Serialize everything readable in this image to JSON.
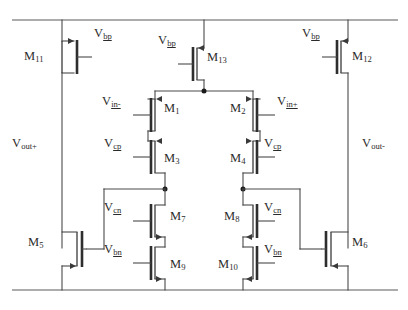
{
  "diagram": {
    "type": "circuit-schematic",
    "width": 408,
    "height": 310,
    "background_color": "#ffffff",
    "wire_color": "#4a4a4a",
    "label_color": "#2b2b2b"
  },
  "rails": {
    "top": {
      "name": "vdd-rail",
      "y": 20,
      "x1": 12,
      "x2": 398
    },
    "bottom": {
      "name": "gnd-rail",
      "y": 290,
      "x1": 12,
      "x2": 398
    }
  },
  "transistors": [
    {
      "id": "M11",
      "base": "M",
      "sub": "11",
      "type": "pmos",
      "gate_label": "Vbp",
      "gate_label_side": "right",
      "id_side": "left"
    },
    {
      "id": "M13",
      "base": "M",
      "sub": "13",
      "type": "pmos",
      "gate_label": "Vbp",
      "gate_label_side": "left",
      "id_side": "right"
    },
    {
      "id": "M12",
      "base": "M",
      "sub": "12",
      "type": "pmos",
      "gate_label": "Vbp",
      "gate_label_side": "left",
      "id_side": "right"
    },
    {
      "id": "M1",
      "base": "M",
      "sub": "1",
      "type": "pmos",
      "gate_label": "Vin-",
      "gate_label_side": "left",
      "id_side": "right"
    },
    {
      "id": "M2",
      "base": "M",
      "sub": "2",
      "type": "pmos",
      "gate_label": "Vin+",
      "gate_label_side": "right",
      "id_side": "left"
    },
    {
      "id": "M3",
      "base": "M",
      "sub": "3",
      "type": "pmos",
      "gate_label": "Vcp",
      "gate_label_side": "left",
      "id_side": "right"
    },
    {
      "id": "M4",
      "base": "M",
      "sub": "4",
      "type": "pmos",
      "gate_label": "Vcp",
      "gate_label_side": "right",
      "id_side": "left"
    },
    {
      "id": "M7",
      "base": "M",
      "sub": "7",
      "type": "nmos",
      "gate_label": "Vcn",
      "gate_label_side": "left",
      "id_side": "right"
    },
    {
      "id": "M8",
      "base": "M",
      "sub": "8",
      "type": "nmos",
      "gate_label": "Vcn",
      "gate_label_side": "right",
      "id_side": "left"
    },
    {
      "id": "M9",
      "base": "M",
      "sub": "9",
      "type": "nmos",
      "gate_label": "Vbn",
      "gate_label_side": "left",
      "id_side": "right"
    },
    {
      "id": "M10",
      "base": "M",
      "sub": "10",
      "type": "nmos",
      "gate_label": "Vbn",
      "gate_label_side": "right",
      "id_side": "left"
    },
    {
      "id": "M5",
      "base": "M",
      "sub": "5",
      "type": "nmos",
      "gate_label": "",
      "gate_label_side": "none",
      "id_side": "left"
    },
    {
      "id": "M6",
      "base": "M",
      "sub": "6",
      "type": "nmos",
      "gate_label": "",
      "gate_label_side": "none",
      "id_side": "right"
    }
  ],
  "labels": {
    "m11": {
      "base": "M",
      "sub": "11"
    },
    "m12": {
      "base": "M",
      "sub": "12"
    },
    "m13": {
      "base": "M",
      "sub": "13"
    },
    "m1": {
      "base": "M",
      "sub": "1"
    },
    "m2": {
      "base": "M",
      "sub": "2"
    },
    "m3": {
      "base": "M",
      "sub": "3"
    },
    "m4": {
      "base": "M",
      "sub": "4"
    },
    "m5": {
      "base": "M",
      "sub": "5"
    },
    "m6": {
      "base": "M",
      "sub": "6"
    },
    "m7": {
      "base": "M",
      "sub": "7"
    },
    "m8": {
      "base": "M",
      "sub": "8"
    },
    "m9": {
      "base": "M",
      "sub": "9"
    },
    "m10": {
      "base": "M",
      "sub": "10"
    },
    "vbp_left": {
      "base": "V",
      "sub": "bp"
    },
    "vbp_mid": {
      "base": "V",
      "sub": "bp"
    },
    "vbp_right": {
      "base": "V",
      "sub": "bp"
    },
    "vin_minus": {
      "base": "V",
      "sub": "in-"
    },
    "vin_plus": {
      "base": "V",
      "sub": "in+"
    },
    "vcp_left": {
      "base": "V",
      "sub": "cp"
    },
    "vcp_right": {
      "base": "V",
      "sub": "cp"
    },
    "vcn_left": {
      "base": "V",
      "sub": "cn"
    },
    "vcn_right": {
      "base": "V",
      "sub": "cn"
    },
    "vbn_left": {
      "base": "V",
      "sub": "bn"
    },
    "vbn_right": {
      "base": "V",
      "sub": "bn"
    },
    "vout_plus": {
      "base": "V",
      "sub": "out+"
    },
    "vout_minus": {
      "base": "V",
      "sub": "out-"
    }
  },
  "nets": [
    {
      "name": "vdd",
      "label": "top supply rail"
    },
    {
      "name": "gnd",
      "label": "bottom ground rail"
    },
    {
      "name": "tail",
      "label": "M13 drain to M1/M2 common source"
    },
    {
      "name": "vout-plus",
      "label": "left output node"
    },
    {
      "name": "vout-minus",
      "label": "right output node"
    },
    {
      "name": "cascode-left",
      "label": "M3 drain / M7 drain node"
    },
    {
      "name": "cascode-right",
      "label": "M4 drain / M8 drain node"
    }
  ]
}
